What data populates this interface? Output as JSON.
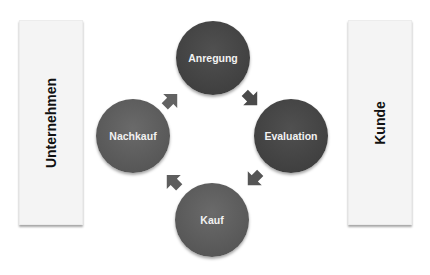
{
  "left_panel": {
    "label": "Unternehmen"
  },
  "right_panel": {
    "label": "Kunde"
  },
  "cycle": {
    "nodes": [
      {
        "id": "anregung",
        "label": "Anregung"
      },
      {
        "id": "evaluation",
        "label": "Evaluation"
      },
      {
        "id": "kauf",
        "label": "Kauf"
      },
      {
        "id": "nachkauf",
        "label": "Nachkauf"
      }
    ],
    "flow": [
      "Anregung",
      "Evaluation",
      "Kauf",
      "Nachkauf",
      "Anregung"
    ]
  },
  "colors": {
    "circle_dark": "#444444",
    "circle_mid": "#5c5c5c",
    "arrow": "#5a5a5a",
    "panel": "#f4f4f4"
  }
}
